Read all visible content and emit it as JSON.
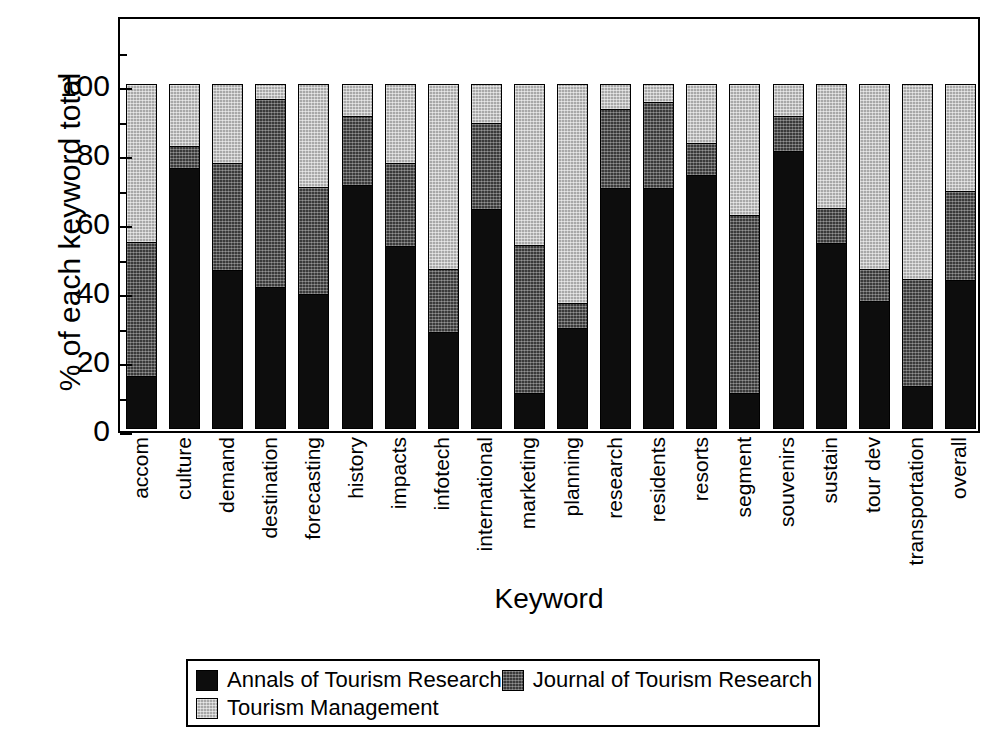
{
  "chart_data": {
    "type": "bar",
    "stacked": true,
    "stack_mode": "percent",
    "title": "",
    "xlabel": "Keyword",
    "ylabel": "% of each keyword total",
    "ylim": [
      0,
      100
    ],
    "yticks": [
      0,
      20,
      40,
      60,
      80,
      100
    ],
    "ytick_labels": [
      "0",
      "20",
      "40",
      "60",
      "80",
      "100"
    ],
    "minor_ticks": [
      10,
      30,
      50,
      70,
      90,
      110
    ],
    "grid": false,
    "legend_position": "bottom",
    "categories": [
      "accom",
      "culture",
      "demand",
      "destination",
      "forecasting",
      "history",
      "impacts",
      "infotech",
      "international",
      "marketing",
      "planning",
      "research",
      "residents",
      "resorts",
      "segment",
      "souvenirs",
      "sustain",
      "tour dev",
      "transportation",
      "overall"
    ],
    "series": [
      {
        "name": "Annals of Tourism Research",
        "color": "#0d0d0d",
        "values": [
          15,
          76,
          46,
          41,
          39,
          71,
          53,
          28,
          64,
          10,
          29,
          70,
          70,
          74,
          10,
          81,
          54,
          37,
          12,
          43
        ]
      },
      {
        "name": "Journal of Tourism Research",
        "color": "#3a3a3a",
        "values": [
          39,
          6,
          31,
          55,
          31,
          20,
          24,
          18,
          25,
          43,
          7,
          23,
          25,
          9,
          52,
          10,
          10,
          9,
          31,
          26
        ]
      },
      {
        "name": "Tourism Management",
        "color": "#a8a8a8",
        "values": [
          46,
          18,
          23,
          4,
          30,
          9,
          23,
          54,
          11,
          47,
          64,
          7,
          5,
          17,
          38,
          9,
          36,
          54,
          57,
          31
        ]
      }
    ]
  },
  "legend": {
    "entries": [
      {
        "label": "Annals of Tourism Research",
        "swatch": "solid-black-swatch"
      },
      {
        "label": "Journal of Tourism Research",
        "swatch": "dark-hatched-swatch"
      },
      {
        "label": "Tourism Management",
        "swatch": "light-stippled-swatch"
      }
    ]
  }
}
